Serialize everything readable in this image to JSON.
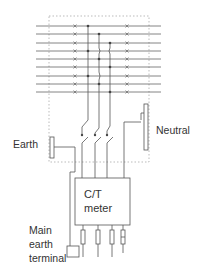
{
  "diagram": {
    "labels": {
      "earth": "Earth",
      "neutral": "Neutral",
      "meter_line1": "C/T",
      "meter_line2": "meter",
      "main_earth_line1": "Main",
      "main_earth_line2": "earth",
      "main_earth_line3": "terminal"
    },
    "busbar_count": 9,
    "phase_switches": 3,
    "meter_outputs": 4,
    "colors": {
      "line": "#555555",
      "dotted": "#aaaaaa",
      "background": "#ffffff"
    }
  }
}
